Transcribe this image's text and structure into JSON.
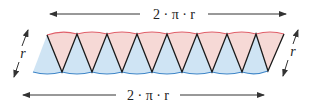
{
  "diagram": {
    "top_label": "2 · π · r",
    "bottom_label": "2 · π · r",
    "left_label": "r",
    "right_label": "r",
    "colors": {
      "top_fill": "#f6d9d6",
      "top_arc": "#e0606a",
      "bottom_fill": "#cfe4f4",
      "bottom_arc": "#3f86c8",
      "edges": "#1a1a1a",
      "arrows": "#333333"
    },
    "sector_count_top": 8,
    "sector_count_bottom": 8
  }
}
